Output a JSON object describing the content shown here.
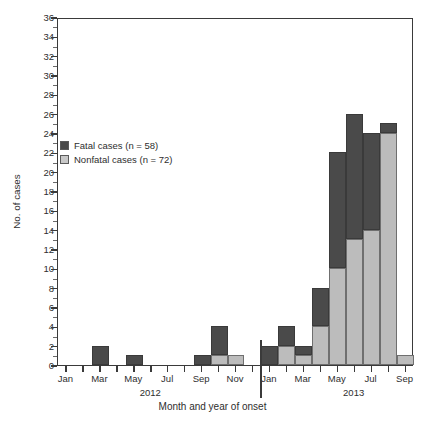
{
  "chart_data": {
    "type": "bar",
    "title": "",
    "subtitle": "",
    "xlabel": "Month and year of onset",
    "ylabel": "No. of cases",
    "ylim": [
      0,
      36
    ],
    "ytick_step": 2,
    "yticks": [
      0,
      2,
      4,
      6,
      8,
      10,
      12,
      14,
      16,
      18,
      20,
      22,
      24,
      26,
      28,
      30,
      32,
      34,
      36
    ],
    "grid": false,
    "stacked": true,
    "legend_position": "inside-upper-left",
    "categories": [
      "Jan 2012",
      "Feb 2012",
      "Mar 2012",
      "Apr 2012",
      "May 2012",
      "Jun 2012",
      "Jul 2012",
      "Aug 2012",
      "Sep 2012",
      "Oct 2012",
      "Nov 2012",
      "Dec 2012",
      "Jan 2013",
      "Feb 2013",
      "Mar 2013",
      "Apr 2013",
      "May 2013",
      "Jun 2013",
      "Jul 2013",
      "Aug 2013",
      "Sep 2013"
    ],
    "xtick_labels": [
      "Jan",
      "Mar",
      "May",
      "Jul",
      "Sep",
      "Nov",
      "Jan",
      "Mar",
      "May",
      "Jul",
      "Sep"
    ],
    "year_groups": [
      {
        "label": "2012",
        "center_category": "Jun 2012"
      },
      {
        "label": "2013",
        "center_category": "Jun 2013"
      }
    ],
    "series": [
      {
        "name": "Fatal cases (n = 58)",
        "color": "#4a4a4a",
        "values": [
          0,
          0,
          2,
          0,
          1,
          0,
          0,
          0,
          1,
          3,
          0,
          0,
          2,
          2,
          1,
          4,
          12,
          13,
          10,
          1,
          0
        ]
      },
      {
        "name": "Nonfatal cases (n = 72)",
        "color": "#bcbcbc",
        "values": [
          0,
          0,
          0,
          0,
          0,
          0,
          0,
          0,
          0,
          1,
          1,
          0,
          0,
          2,
          1,
          4,
          10,
          13,
          14,
          24,
          1
        ]
      }
    ]
  },
  "legend": {
    "items": [
      {
        "label": "Fatal cases (n = 58)",
        "swatch": "fatal"
      },
      {
        "label": "Nonfatal cases (n = 72)",
        "swatch": "nonfatal"
      }
    ]
  },
  "axis": {
    "y_title": "No. of cases",
    "x_title": "Month and year of onset"
  }
}
